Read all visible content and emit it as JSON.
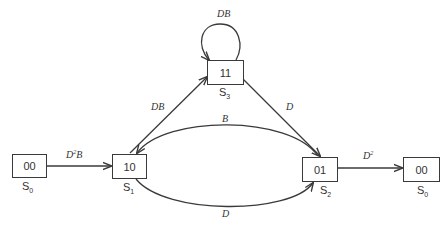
{
  "diagram": {
    "type": "state-diagram",
    "states": [
      {
        "id": "s0_left",
        "code": "00",
        "label": "S",
        "sub": "0"
      },
      {
        "id": "s1",
        "code": "10",
        "label": "S",
        "sub": "1"
      },
      {
        "id": "s3",
        "code": "11",
        "label": "S",
        "sub": "3"
      },
      {
        "id": "s2",
        "code": "01",
        "label": "S",
        "sub": "2"
      },
      {
        "id": "s0_right",
        "code": "00",
        "label": "S",
        "sub": "0"
      }
    ],
    "edges": [
      {
        "from": "s0_left",
        "to": "s1",
        "label": "D",
        "sup": "2",
        "suffix": "B"
      },
      {
        "from": "s1",
        "to": "s3",
        "label": "DB",
        "sup": "",
        "suffix": ""
      },
      {
        "from": "s3",
        "to": "s3",
        "label": "DB",
        "sup": "",
        "suffix": ""
      },
      {
        "from": "s3",
        "to": "s2",
        "label": "D",
        "sup": "",
        "suffix": ""
      },
      {
        "from": "s2",
        "to": "s1",
        "label": "B",
        "sup": "",
        "suffix": ""
      },
      {
        "from": "s1",
        "to": "s2",
        "label": "D",
        "sup": "",
        "suffix": ""
      },
      {
        "from": "s2",
        "to": "s0_right",
        "label": "D",
        "sup": "2",
        "suffix": ""
      }
    ]
  },
  "colors": {
    "stroke": "#3a3a3a",
    "text": "#333333"
  }
}
